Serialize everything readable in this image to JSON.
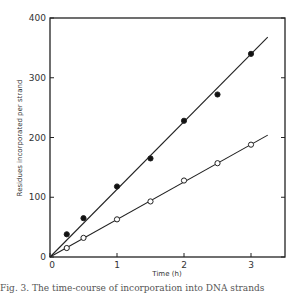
{
  "chart_data": {
    "type": "scatter",
    "title": "",
    "xlabel": "Time (h)",
    "ylabel": "Residues incorporated per strand",
    "xlim": [
      0,
      3.5
    ],
    "ylim": [
      0,
      400
    ],
    "x_ticks": [
      0,
      1,
      2,
      3
    ],
    "y_ticks": [
      0,
      100,
      200,
      300,
      400
    ],
    "x_tick_labels": [
      "0",
      "1",
      "2",
      "3"
    ],
    "y_tick_labels": [
      "0",
      "100",
      "200",
      "300",
      "400"
    ],
    "grid": false,
    "legend": null,
    "series": [
      {
        "name": "filled circles",
        "marker": "filled-circle",
        "x": [
          0.25,
          0.5,
          1.0,
          1.5,
          2.0,
          2.5,
          3.0
        ],
        "values": [
          38,
          65,
          118,
          165,
          228,
          272,
          340
        ],
        "fit_line": {
          "x": [
            0,
            3.25
          ],
          "y": [
            0,
            368
          ]
        }
      },
      {
        "name": "open circles",
        "marker": "open-circle",
        "x": [
          0.25,
          0.5,
          1.0,
          1.5,
          2.0,
          2.5,
          3.0
        ],
        "values": [
          15,
          32,
          63,
          93,
          128,
          157,
          188
        ],
        "fit_line": {
          "x": [
            0,
            3.25
          ],
          "y": [
            0,
            204
          ]
        }
      }
    ]
  },
  "caption": "Fig. 3. The time-course of incorporation into DNA strands"
}
